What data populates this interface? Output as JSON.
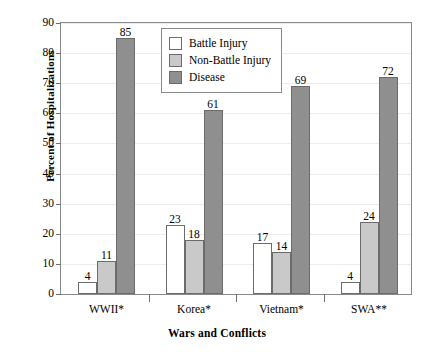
{
  "chart_data": {
    "type": "bar",
    "title": "",
    "subtitle": "",
    "xlabel": "Wars and Conflicts",
    "ylabel": "Percent of Hospitalizations",
    "categories": [
      "WWII*",
      "Korea*",
      "Vietnam*",
      "SWA**"
    ],
    "series": [
      {
        "name": "Battle Injury",
        "color": "#ffffff",
        "values": [
          4,
          23,
          17,
          4
        ]
      },
      {
        "name": "Non-Battle Injury",
        "color": "#c9c9c9",
        "values": [
          11,
          18,
          14,
          24
        ]
      },
      {
        "name": "Disease",
        "color": "#8f8f8f",
        "values": [
          85,
          61,
          69,
          72
        ]
      }
    ],
    "ylim": [
      0,
      90
    ],
    "ytick_values": [
      0,
      10,
      20,
      30,
      40,
      50,
      60,
      70,
      80,
      90
    ],
    "ytick_labels": [
      "0",
      "10",
      "20",
      "30",
      "40",
      "50",
      "60",
      "70",
      "80",
      "90"
    ],
    "grid": true,
    "grid_axis": "y",
    "legend_position": "upper center",
    "data_labels": true,
    "bar_edge_color": "#6b6b6b",
    "axis_color": "#8a8a8a",
    "grid_color": "#ececec"
  }
}
